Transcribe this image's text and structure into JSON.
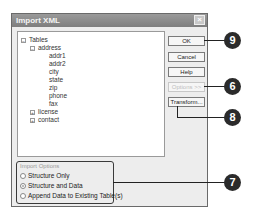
{
  "dialog": {
    "title": "Import XML",
    "close_symbol": "×"
  },
  "tree": {
    "root": {
      "label": "Tables",
      "expander": "−"
    },
    "nodes": [
      {
        "label": "address",
        "expander": "−"
      },
      {
        "label": "addr1"
      },
      {
        "label": "addr2"
      },
      {
        "label": "city"
      },
      {
        "label": "state"
      },
      {
        "label": "zip"
      },
      {
        "label": "phone"
      },
      {
        "label": "fax"
      },
      {
        "label": "license",
        "expander": "+"
      },
      {
        "label": "contact",
        "expander": "+"
      }
    ]
  },
  "buttons": {
    "ok": "OK",
    "cancel": "Cancel",
    "help": "Help",
    "options": "Options >>",
    "transform": "Transform..."
  },
  "import_options": {
    "legend": "Import Options",
    "choices": [
      {
        "label": "Structure Only",
        "selected": false
      },
      {
        "label": "Structure and Data",
        "selected": true
      },
      {
        "label": "Append Data to Existing Table(s)",
        "selected": false
      }
    ]
  },
  "callouts": {
    "ok": "9",
    "options": "6",
    "transform": "8",
    "import_options": "7"
  }
}
